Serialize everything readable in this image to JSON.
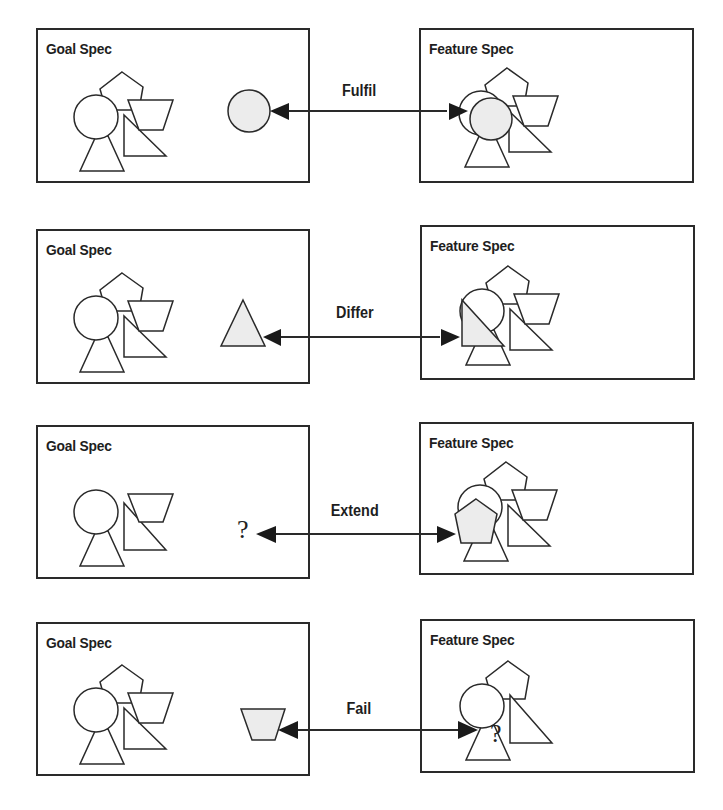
{
  "diagram": {
    "rows": [
      {
        "relation": "Fulfil",
        "goal": {
          "title": "Goal Spec",
          "shapes": [
            "circle",
            "pentagon",
            "trapezoid",
            "triangle",
            "right-triangle"
          ],
          "item": "circle"
        },
        "feature": {
          "title": "Feature Spec",
          "shapes": [
            "circle",
            "pentagon",
            "trapezoid",
            "triangle",
            "right-triangle"
          ],
          "item": "circle"
        }
      },
      {
        "relation": "Differ",
        "goal": {
          "title": "Goal Spec",
          "shapes": [
            "circle",
            "pentagon",
            "trapezoid",
            "triangle",
            "right-triangle"
          ],
          "item": "triangle"
        },
        "feature": {
          "title": "Feature Spec",
          "shapes": [
            "circle",
            "pentagon",
            "trapezoid",
            "triangle",
            "right-triangle"
          ],
          "item": "right-triangle"
        }
      },
      {
        "relation": "Extend",
        "goal": {
          "title": "Goal Spec",
          "shapes": [
            "circle",
            "trapezoid",
            "triangle",
            "right-triangle"
          ],
          "item": "?"
        },
        "feature": {
          "title": "Feature Spec",
          "shapes": [
            "circle",
            "pentagon",
            "trapezoid",
            "triangle",
            "right-triangle"
          ],
          "item": "pentagon"
        }
      },
      {
        "relation": "Fail",
        "goal": {
          "title": "Goal Spec",
          "shapes": [
            "circle",
            "pentagon",
            "trapezoid",
            "triangle",
            "right-triangle"
          ],
          "item": "trapezoid"
        },
        "feature": {
          "title": "Feature Spec",
          "shapes": [
            "circle",
            "pentagon",
            "triangle",
            "right-triangle"
          ],
          "item": "?"
        }
      }
    ],
    "unknown_symbol": "?",
    "colors": {
      "stroke": "#2a2a2a",
      "highlight_fill": "#ececec",
      "background": "#ffffff"
    }
  }
}
